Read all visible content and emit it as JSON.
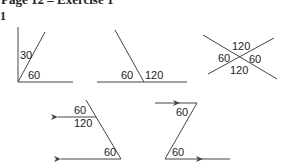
{
  "header": {
    "title": "Page 12 – Exercise 1",
    "question_number": "1"
  },
  "figures": [
    {
      "id": "fig1",
      "labels": [
        "30",
        "60"
      ]
    },
    {
      "id": "fig2",
      "labels": [
        "60",
        "120"
      ]
    },
    {
      "id": "fig3",
      "labels": [
        "120",
        "60",
        "60",
        "120"
      ]
    },
    {
      "id": "fig4",
      "labels": [
        "60",
        "120",
        "60"
      ]
    },
    {
      "id": "fig5",
      "labels": [
        "60",
        "60"
      ]
    }
  ],
  "colors": {
    "line": "#444444",
    "text": "#222222",
    "background": "#ffffff"
  }
}
